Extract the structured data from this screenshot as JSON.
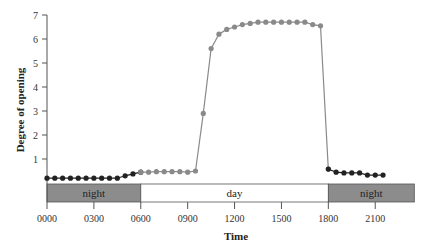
{
  "chart_data": {
    "type": "line",
    "title": "",
    "xlabel": "Time",
    "ylabel": "Degree of opening",
    "xlim": [
      0,
      24
    ],
    "ylim": [
      0,
      7
    ],
    "grid": false,
    "x_ticks": [
      {
        "value": 0,
        "label": "0000"
      },
      {
        "value": 3,
        "label": "0300"
      },
      {
        "value": 6,
        "label": "0600"
      },
      {
        "value": 9,
        "label": "0900"
      },
      {
        "value": 12,
        "label": "1200"
      },
      {
        "value": 15,
        "label": "1500"
      },
      {
        "value": 18,
        "label": "1800"
      },
      {
        "value": 21,
        "label": "2100"
      }
    ],
    "y_ticks": [
      1,
      2,
      3,
      4,
      5,
      6,
      7
    ],
    "bands": [
      {
        "label": "night",
        "start": 0,
        "end": 6,
        "color": "#8c8c8c"
      },
      {
        "label": "day",
        "start": 6,
        "end": 18,
        "color": "#ffffff"
      },
      {
        "label": "night",
        "start": 18,
        "end": 23.5,
        "color": "#8c8c8c"
      }
    ],
    "series": [
      {
        "name": "night (early)",
        "color": "#222222",
        "x": [
          0,
          0.5,
          1,
          1.5,
          2,
          2.5,
          3,
          3.5,
          4,
          4.5,
          5,
          5.5,
          6
        ],
        "values": [
          0.2,
          0.2,
          0.2,
          0.2,
          0.2,
          0.2,
          0.2,
          0.2,
          0.2,
          0.2,
          0.3,
          0.38,
          0.45
        ]
      },
      {
        "name": "day",
        "color": "#8a8a8a",
        "x": [
          6,
          6.5,
          7,
          7.5,
          8,
          8.5,
          9,
          9.5,
          10,
          10.5,
          11,
          11.5,
          12,
          12.5,
          13,
          13.5,
          14,
          14.5,
          15,
          15.5,
          16,
          16.5,
          17,
          17.5,
          18
        ],
        "values": [
          0.45,
          0.45,
          0.47,
          0.47,
          0.47,
          0.47,
          0.45,
          0.5,
          2.9,
          5.6,
          6.2,
          6.4,
          6.5,
          6.6,
          6.65,
          6.7,
          6.7,
          6.7,
          6.7,
          6.7,
          6.7,
          6.7,
          6.6,
          6.55,
          0.58
        ]
      },
      {
        "name": "night (late)",
        "color": "#222222",
        "x": [
          18,
          18.5,
          19,
          19.5,
          20,
          20.5,
          21,
          21.5
        ],
        "values": [
          0.58,
          0.45,
          0.42,
          0.42,
          0.42,
          0.33,
          0.33,
          0.33
        ]
      }
    ]
  }
}
